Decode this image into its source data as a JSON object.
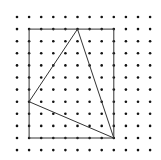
{
  "diagram": {
    "type": "dot-grid-geometry",
    "grid": {
      "columns": 12,
      "rows": 12
    },
    "rectangle": {
      "from": [
        1,
        1
      ],
      "to": [
        8,
        10
      ]
    },
    "triangle": {
      "vertices": [
        [
          5,
          1
        ],
        [
          1,
          7
        ],
        [
          8,
          10
        ]
      ]
    },
    "colors": {
      "dot": "#111111",
      "line": "#333333",
      "background": "#ffffff"
    }
  }
}
